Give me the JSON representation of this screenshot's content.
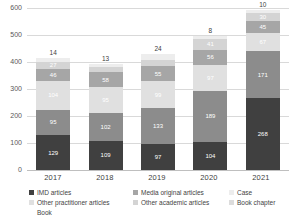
{
  "chart_data": {
    "type": "bar",
    "subtype": "stacked-bar",
    "title": "",
    "xlabel": "",
    "ylabel": "",
    "ylim": [
      0,
      600
    ],
    "yticks": [
      "0",
      "100",
      "200",
      "300",
      "400",
      "500",
      "600"
    ],
    "grid": true,
    "legend_position": "bottom",
    "categories": [
      "2017",
      "2018",
      "2019",
      "2020",
      "2021"
    ],
    "series": [
      {
        "name": "IMD articles",
        "color": "#404040",
        "label_color": "#ffffff",
        "values": [
          129,
          109,
          97,
          104,
          268
        ]
      },
      {
        "name": "Media original articles",
        "color": "#8c8c8c",
        "label_color": "#ffffff",
        "values": [
          95,
          102,
          133,
          189,
          171
        ]
      },
      {
        "name": "Other practitioner articles",
        "color": "#e0e0e0",
        "label_color": "#ffffff",
        "values": [
          104,
          95,
          99,
          97,
          67
        ]
      },
      {
        "name": "Other academic articles",
        "color": "#a6a6a6",
        "label_color": "#ffffff",
        "values": [
          46,
          58,
          55,
          56,
          45
        ]
      },
      {
        "name": "Case",
        "color": "#d4d4d4",
        "label_color": "#ffffff",
        "values": [
          27,
          16,
          22,
          41,
          30
        ]
      },
      {
        "name": "Book chapter",
        "color": "#ededed",
        "label_color": "#ffffff",
        "values": [
          14,
          13,
          24,
          8,
          10
        ]
      },
      {
        "name": "Book",
        "color": "#f5f5f5",
        "label_color": "#ffffff",
        "values": [
          0,
          0,
          0,
          0,
          0
        ]
      }
    ],
    "top_labels": [
      "14",
      "13",
      "24",
      "8",
      "10"
    ],
    "segment_labels": [
      [
        "129",
        "95",
        "104",
        "46",
        "27"
      ],
      [
        "109",
        "102",
        "95",
        "58",
        "16"
      ],
      [
        "97",
        "133",
        "99",
        "55",
        "22"
      ],
      [
        "104",
        "189",
        "97",
        "56",
        "41"
      ],
      [
        "268",
        "171",
        "67",
        "45",
        "30"
      ]
    ]
  },
  "legend": {
    "entries": [
      {
        "label": "IMD articles",
        "color": "#404040"
      },
      {
        "label": "Other practitioner articles",
        "color": "#e0e0e0"
      },
      {
        "label": "Book",
        "color": "#f5f5f5"
      },
      {
        "label": "Media original articles",
        "color": "#8c8c8c"
      },
      {
        "label": "Other academic articles",
        "color": "#d4d4d4"
      },
      {
        "label": "Case",
        "color": "#ededed"
      },
      {
        "label": "Book chapter",
        "color": "#dcdcdc"
      }
    ]
  }
}
